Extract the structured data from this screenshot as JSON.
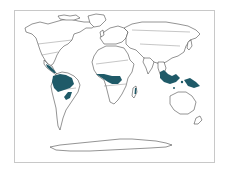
{
  "map": {
    "subject": "World distribution of tropical rainforest",
    "projection": "world outline",
    "colors": {
      "background": "#ffffff",
      "frame": "#c8c8c8",
      "coastline": "#3a3a3a",
      "highlight": "#1f5a68"
    },
    "highlighted_regions": [
      {
        "name": "Central America",
        "label": ""
      },
      {
        "name": "Amazon Basin",
        "label": ""
      },
      {
        "name": "Atlantic Coast Brazil",
        "label": ""
      },
      {
        "name": "Congo Basin",
        "label": ""
      },
      {
        "name": "Madagascar East Coast",
        "label": ""
      },
      {
        "name": "Southeast Asia / Indonesia",
        "label": ""
      },
      {
        "name": "New Guinea",
        "label": ""
      }
    ]
  }
}
